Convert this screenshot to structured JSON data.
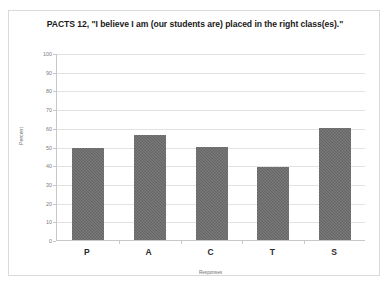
{
  "chart_data": {
    "type": "bar",
    "title": "PACTS 12, \"I believe I am (our students are) placed in the right class(es).\"",
    "xlabel": "Responses",
    "ylabel": "Percent",
    "categories": [
      "P",
      "A",
      "C",
      "T",
      "S"
    ],
    "values": [
      49,
      56,
      50,
      39,
      60
    ],
    "ylim": [
      0,
      100
    ],
    "yticks": [
      0,
      10,
      20,
      30,
      40,
      50,
      60,
      70,
      80,
      90,
      100
    ],
    "ytick_labels": [
      "0",
      "10",
      "20",
      "30",
      "40",
      "50",
      "60",
      "70",
      "80",
      "90",
      "100"
    ],
    "grid": true,
    "legend": false,
    "series": [
      {
        "name": "Percent",
        "values": [
          49,
          56,
          50,
          39,
          60
        ],
        "color": "#6b6b6b"
      }
    ],
    "colors": {
      "bar": "#6b6b6b",
      "gridline": "#e2e2e2",
      "axis": "#c8c8c8",
      "title_text": "#1a1a1a",
      "tick_text": "#7a7a7a",
      "card_border": "#d9d9d9",
      "background": "#ffffff"
    }
  }
}
